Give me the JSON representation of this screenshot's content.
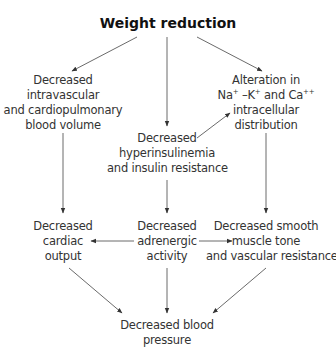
{
  "diagram": {
    "title": "Weight reduction",
    "nodes": {
      "blood_volume": [
        "Decreased",
        "intravascular",
        "and cardiopulmonary",
        "blood volume"
      ],
      "ion_alteration": {
        "line1": "Alteration in",
        "na": "Na",
        "na_sup": "+",
        "k": " –K",
        "k_sup": "+",
        "ca": " and Ca",
        "ca_sup": "++",
        "line3": "intracellular",
        "line4": "distribution"
      },
      "hyperinsulinemia": [
        "Decreased",
        "hyperinsulinemia",
        "and insulin resistance"
      ],
      "cardiac_output": [
        "Decreased",
        "cardiac",
        "output"
      ],
      "adrenergic": [
        "Decreased",
        "adrenergic",
        "activity"
      ],
      "smooth_muscle": [
        "Decreased smooth",
        "muscle tone",
        "and vascular resistance"
      ],
      "blood_pressure": [
        "Decreased blood",
        "pressure"
      ]
    },
    "edges": [
      {
        "from": "Weight reduction",
        "to": "Decreased intravascular and cardiopulmonary blood volume"
      },
      {
        "from": "Weight reduction",
        "to": "Decreased hyperinsulinemia and insulin resistance"
      },
      {
        "from": "Weight reduction",
        "to": "Alteration in Na+ -K+ and Ca++ intracellular distribution"
      },
      {
        "from": "Decreased hyperinsulinemia and insulin resistance",
        "to": "Alteration in Na+ -K+ and Ca++ intracellular distribution"
      },
      {
        "from": "Decreased intravascular and cardiopulmonary blood volume",
        "to": "Decreased cardiac output"
      },
      {
        "from": "Decreased hyperinsulinemia and insulin resistance",
        "to": "Decreased adrenergic activity"
      },
      {
        "from": "Alteration in Na+ -K+ and Ca++ intracellular distribution",
        "to": "Decreased smooth muscle tone and vascular resistance"
      },
      {
        "from": "Decreased adrenergic activity",
        "to": "Decreased cardiac output"
      },
      {
        "from": "Decreased adrenergic activity",
        "to": "Decreased smooth muscle tone and vascular resistance"
      },
      {
        "from": "Decreased cardiac output",
        "to": "Decreased blood pressure"
      },
      {
        "from": "Decreased adrenergic activity",
        "to": "Decreased blood pressure"
      },
      {
        "from": "Decreased smooth muscle tone and vascular resistance",
        "to": "Decreased blood pressure"
      }
    ]
  }
}
